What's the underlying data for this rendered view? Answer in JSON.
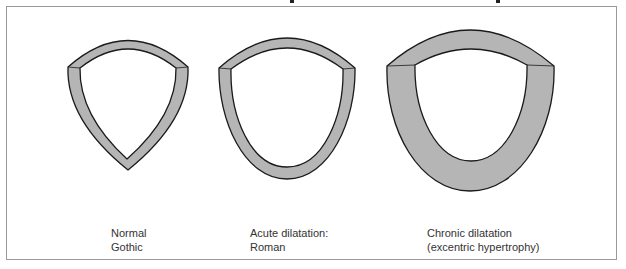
{
  "figure": {
    "colors": {
      "wall_fill": "#b5b5b5",
      "outline": "#1a1a1a",
      "frame": "#9a9a9a",
      "text": "#333333"
    },
    "panels": [
      {
        "id": "normal",
        "label_line1": "Normal",
        "label_line2": "Gothic"
      },
      {
        "id": "acute",
        "label_line1": "Acute dilatation:",
        "label_line2": "Roman"
      },
      {
        "id": "chronic",
        "label_line1": "Chronic dilatation",
        "label_line2": "(excentric hypertrophy)"
      }
    ]
  }
}
